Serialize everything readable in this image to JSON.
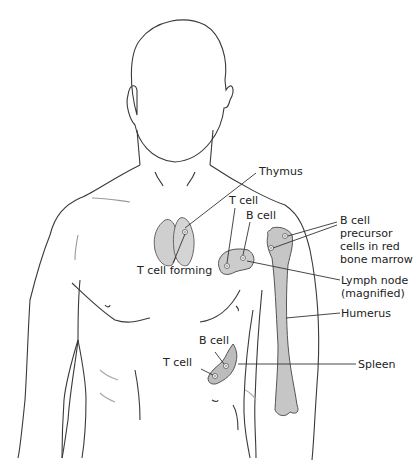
{
  "figure": {
    "colors": {
      "outline": "#3a3a3a",
      "organ_fill": "#c8c8c8",
      "organ_stroke": "#555555",
      "text": "#222222"
    }
  },
  "labels": {
    "thymus": "Thymus",
    "t_cell_forming": "T cell forming",
    "lymph_t_cell": "T cell",
    "lymph_b_cell": "B cell",
    "bone_marrow_line1": "B cell",
    "bone_marrow_line2": "precursor",
    "bone_marrow_line3": "cells in red",
    "bone_marrow_line4": "bone marrow",
    "lymph_node_line1": "Lymph node",
    "lymph_node_line2": "(magnified)",
    "humerus": "Humerus",
    "spleen_b_cell": "B cell",
    "spleen_t_cell": "T cell",
    "spleen": "Spleen"
  }
}
